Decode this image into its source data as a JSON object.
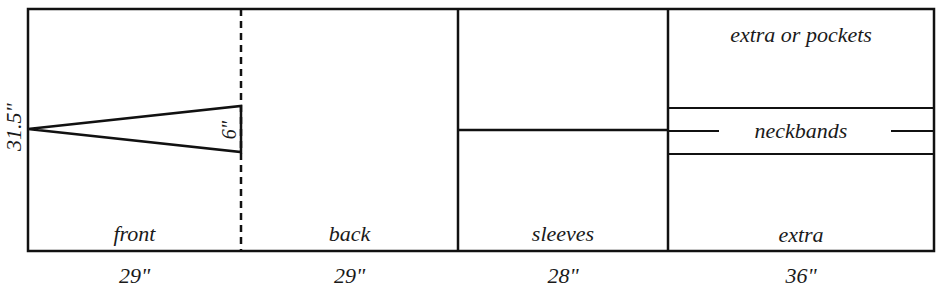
{
  "diagram": {
    "title": "",
    "height_label": "31.5\"",
    "dart_label": "6\"",
    "sections": [
      {
        "name": "front",
        "label": "front",
        "width_label": "29\""
      },
      {
        "name": "back",
        "label": "back",
        "width_label": "29\""
      },
      {
        "name": "sleeves",
        "label": "sleeves",
        "width_label": "28\""
      },
      {
        "name": "extra",
        "label": "extra",
        "width_label": "36\""
      }
    ],
    "extra_column": {
      "top_label": "extra or pockets",
      "middle_label": "neckbands",
      "bottom_label": "extra"
    },
    "line_color": "#111111"
  }
}
